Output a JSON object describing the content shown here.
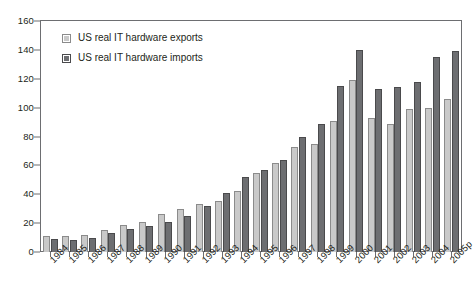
{
  "chart_data": {
    "type": "bar",
    "title": "",
    "subtitle": "",
    "xlabel": "",
    "ylabel": "",
    "ylim": [
      0,
      160
    ],
    "yticks": [
      0,
      20,
      40,
      60,
      80,
      100,
      120,
      140,
      160
    ],
    "grid": false,
    "legend_position": "top-left",
    "categories": [
      "1984",
      "1985",
      "1986",
      "1987",
      "1988",
      "1989",
      "1990",
      "1991",
      "1992",
      "1993",
      "1994",
      "1995",
      "1996",
      "1997",
      "1998",
      "1999",
      "2000",
      "2001",
      "2002",
      "2003",
      "2004",
      "2005p"
    ],
    "series": [
      {
        "name": "US real IT hardware exports",
        "color": "#c9c9c9",
        "values": [
          11,
          11,
          12,
          15,
          19,
          21,
          26,
          30,
          33,
          35,
          42,
          55,
          62,
          73,
          75,
          91,
          119,
          93,
          89,
          99,
          100,
          106
        ]
      },
      {
        "name": "US real IT hardware imports",
        "color": "#6d6e71",
        "values": [
          9,
          8,
          10,
          13,
          16,
          18,
          21,
          25,
          32,
          41,
          52,
          57,
          64,
          80,
          89,
          115,
          140,
          113,
          114,
          118,
          135,
          139
        ]
      }
    ]
  },
  "legend": {
    "items": [
      {
        "label": "US real IT hardware exports",
        "swatch": "light-gray-swatch"
      },
      {
        "label": "US real IT hardware imports",
        "swatch": "dark-gray-swatch"
      }
    ]
  },
  "axes": {
    "y": {
      "labels": [
        "160",
        "140",
        "120",
        "100",
        "80",
        "60",
        "40",
        "20",
        "0"
      ]
    },
    "x": {
      "labels": [
        "1984",
        "1985",
        "1986",
        "1987",
        "1988",
        "1989",
        "1990",
        "1991",
        "1992",
        "1993",
        "1994",
        "1995",
        "1996",
        "1997",
        "1998",
        "1999",
        "2000",
        "2001",
        "2002",
        "2003",
        "2004",
        "2005p"
      ]
    }
  },
  "colors": {
    "exports": "#c9c9c9",
    "imports": "#6d6e71",
    "axis": "#6d6e71",
    "text": "#231f20",
    "background": "#ffffff"
  }
}
